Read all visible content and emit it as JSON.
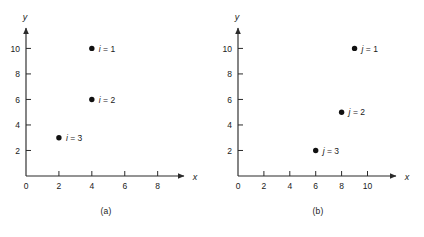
{
  "figure": {
    "panels": [
      {
        "id": "a",
        "caption": "(a)",
        "chart_data": {
          "type": "scatter",
          "title": "",
          "xlabel": "x",
          "ylabel": "y",
          "xlim": [
            0,
            9.6
          ],
          "ylim": [
            0,
            11.6
          ],
          "xticks": [
            0,
            2,
            4,
            6,
            8
          ],
          "xtick_labels": [
            "0",
            "2",
            "4",
            "6",
            "8"
          ],
          "yticks": [
            2,
            4,
            6,
            8,
            10
          ],
          "ytick_labels": [
            "2",
            "4",
            "6",
            "8",
            "10"
          ],
          "grid": false,
          "legend": "none",
          "points": [
            {
              "x": 4,
              "y": 10,
              "label_var": "i",
              "label_eq": "= 1",
              "label": "i = 1"
            },
            {
              "x": 4,
              "y": 6,
              "label_var": "i",
              "label_eq": "= 2",
              "label": "i = 2"
            },
            {
              "x": 2,
              "y": 3,
              "label_var": "i",
              "label_eq": "= 3",
              "label": "i = 3"
            }
          ]
        }
      },
      {
        "id": "b",
        "caption": "(b)",
        "chart_data": {
          "type": "scatter",
          "title": "",
          "xlabel": "x",
          "ylabel": "y",
          "xlim": [
            0,
            12.2
          ],
          "ylim": [
            0,
            11.6
          ],
          "xticks": [
            0,
            2,
            4,
            6,
            8,
            10
          ],
          "xtick_labels": [
            "0",
            "2",
            "4",
            "6",
            "8",
            "10"
          ],
          "yticks": [
            2,
            4,
            6,
            8,
            10
          ],
          "ytick_labels": [
            "2",
            "4",
            "6",
            "8",
            "10"
          ],
          "grid": false,
          "legend": "none",
          "points": [
            {
              "x": 9,
              "y": 10,
              "label_var": "j",
              "label_eq": "= 1",
              "label": "j = 1"
            },
            {
              "x": 8,
              "y": 5,
              "label_var": "j",
              "label_eq": "= 2",
              "label": "j = 2"
            },
            {
              "x": 6,
              "y": 2,
              "label_var": "j",
              "label_eq": "= 3",
              "label": "j = 3"
            }
          ]
        }
      }
    ],
    "colors": {
      "axis": "#2b2b2b",
      "point": "#111111",
      "text": "#1a1a1a",
      "background": "#ffffff"
    }
  }
}
